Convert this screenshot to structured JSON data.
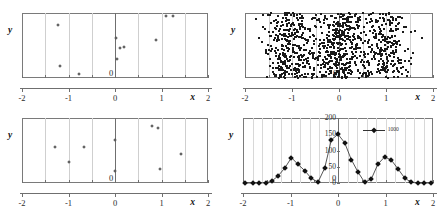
{
  "figure": {
    "axis_names": {
      "x": "x",
      "y": "y"
    },
    "origin_label": "0"
  },
  "chart_data": [
    {
      "id": "panel-top-left",
      "type": "scatter",
      "title": "",
      "xlabel": "x",
      "ylabel": "y",
      "xlim": [
        -2,
        2
      ],
      "ylim": [
        0,
        1
      ],
      "xticks": [
        -2,
        -1,
        0,
        1,
        2
      ],
      "xticklabels": [
        "-2",
        "-1",
        "0",
        "1",
        "2"
      ],
      "yticks": [],
      "yticklabels": [],
      "grid": true,
      "gridline_spacing": 0.5,
      "legend": null,
      "n": 10,
      "points": [
        {
          "x": -1.22,
          "y": 0.82
        },
        {
          "x": -1.19,
          "y": 0.18
        },
        {
          "x": -0.77,
          "y": 0.06
        },
        {
          "x": 0.02,
          "y": 0.62
        },
        {
          "x": 0.04,
          "y": 0.29
        },
        {
          "x": 0.1,
          "y": 0.46
        },
        {
          "x": 0.19,
          "y": 0.47
        },
        {
          "x": 0.89,
          "y": 0.58
        },
        {
          "x": 1.1,
          "y": 0.95
        },
        {
          "x": 1.25,
          "y": 0.95
        }
      ]
    },
    {
      "id": "panel-top-right",
      "type": "scatter",
      "title": "",
      "xlabel": "x",
      "ylabel": "y",
      "xlim": [
        -2,
        2
      ],
      "ylim": [
        0,
        1
      ],
      "xticks": [
        -2,
        -1,
        0,
        1,
        2
      ],
      "xticklabels": [
        "-2",
        "-1",
        "0",
        "1",
        "2"
      ],
      "yticks": [],
      "yticklabels": [],
      "grid": true,
      "gridline_spacing": 0.5,
      "legend": null,
      "n": 1000,
      "description": "Three dense vertical bands of points centred near x = -1, x = 0 and x = 1; the central band is the densest.",
      "cluster_centers": [
        -1,
        0,
        1
      ],
      "cluster_spread": 0.28,
      "cluster_weights": [
        0.33,
        0.4,
        0.27
      ]
    },
    {
      "id": "panel-bottom-left",
      "type": "scatter",
      "title": "",
      "xlabel": "x",
      "ylabel": "y",
      "xlim": [
        -2,
        2
      ],
      "ylim": [
        0,
        1
      ],
      "xticks": [
        -2,
        -1,
        0,
        1,
        2
      ],
      "xticklabels": [
        "-2",
        "-1",
        "0",
        "1",
        "2"
      ],
      "yticks": [],
      "yticklabels": [],
      "grid": true,
      "gridline_spacing": 0.5,
      "legend": null,
      "n": 10,
      "points": [
        {
          "x": -1.28,
          "y": 0.55
        },
        {
          "x": -1.0,
          "y": 0.33
        },
        {
          "x": -0.66,
          "y": 0.56
        },
        {
          "x": 0.0,
          "y": 0.66
        },
        {
          "x": 0.0,
          "y": 0.19
        },
        {
          "x": 0.79,
          "y": 0.87
        },
        {
          "x": 0.92,
          "y": 0.84
        },
        {
          "x": 0.97,
          "y": 0.22
        },
        {
          "x": 1.42,
          "y": 0.44
        }
      ]
    },
    {
      "id": "panel-bottom-right",
      "type": "line",
      "title": "",
      "xlabel": "x",
      "ylabel": "y",
      "xlim": [
        -2,
        2
      ],
      "ylim": [
        0,
        200
      ],
      "xticks": [
        -2,
        -1,
        0,
        1,
        2
      ],
      "xticklabels": [
        "-2",
        "-1",
        "0",
        "1",
        "2"
      ],
      "yticks": [
        0,
        50,
        100,
        150,
        200
      ],
      "yticklabels": [
        "0",
        "50",
        "100",
        "150",
        "200"
      ],
      "grid": true,
      "gridline_spacing": 0.2,
      "legend": {
        "position": "upper-right",
        "entries": [
          "1000"
        ]
      },
      "series": [
        {
          "name": "1000",
          "x": [
            -1.9,
            -1.7,
            -1.5,
            -1.3,
            -1.1,
            -0.9,
            -0.7,
            -0.5,
            -0.3,
            -0.1,
            0.1,
            0.3,
            0.5,
            0.7,
            0.9,
            1.1,
            1.3,
            1.5,
            1.7,
            1.9
          ],
          "values": [
            0,
            0,
            0,
            22,
            46,
            78,
            57,
            20,
            2,
            133,
            150,
            124,
            38,
            3,
            12,
            60,
            83,
            71,
            30,
            4
          ]
        }
      ],
      "data_points": [
        {
          "x": -1.95,
          "y": 0
        },
        {
          "x": -1.8,
          "y": 0
        },
        {
          "x": -1.66,
          "y": 0
        },
        {
          "x": -1.52,
          "y": 1
        },
        {
          "x": -1.4,
          "y": 5
        },
        {
          "x": -1.26,
          "y": 22
        },
        {
          "x": -1.12,
          "y": 46
        },
        {
          "x": -0.98,
          "y": 78
        },
        {
          "x": -0.84,
          "y": 57
        },
        {
          "x": -0.7,
          "y": 38
        },
        {
          "x": -0.56,
          "y": 14
        },
        {
          "x": -0.42,
          "y": 3
        },
        {
          "x": -0.28,
          "y": 46
        },
        {
          "x": -0.14,
          "y": 133
        },
        {
          "x": 0.0,
          "y": 150
        },
        {
          "x": 0.14,
          "y": 124
        },
        {
          "x": 0.28,
          "y": 72
        },
        {
          "x": 0.42,
          "y": 34
        },
        {
          "x": 0.56,
          "y": 2
        },
        {
          "x": 0.7,
          "y": 12
        },
        {
          "x": 0.84,
          "y": 58
        },
        {
          "x": 0.98,
          "y": 80
        },
        {
          "x": 1.12,
          "y": 71
        },
        {
          "x": 1.26,
          "y": 44
        },
        {
          "x": 1.4,
          "y": 16
        },
        {
          "x": 1.54,
          "y": 2
        },
        {
          "x": 1.68,
          "y": 0
        },
        {
          "x": 1.82,
          "y": 0
        },
        {
          "x": 1.95,
          "y": 0
        }
      ]
    }
  ]
}
